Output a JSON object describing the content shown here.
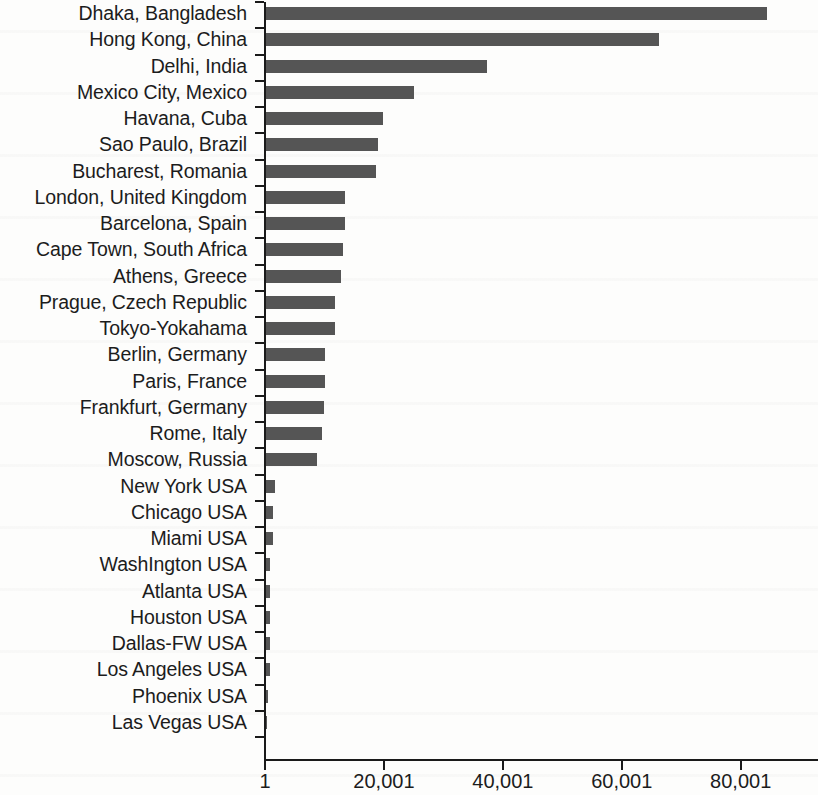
{
  "chart_data": {
    "type": "bar",
    "orientation": "horizontal",
    "title": "",
    "subtitle": "",
    "xlabel": "",
    "ylabel": "",
    "grid": false,
    "legend": null,
    "xlim": [
      1,
      93000
    ],
    "x_tick_labels": [
      "1",
      "20,001",
      "40,001",
      "60,001",
      "80,001"
    ],
    "x_tick_values": [
      1,
      20001,
      40001,
      60001,
      80001
    ],
    "bar_color": "#555555",
    "axis_color": "#1a1a1a",
    "categories": [
      "Dhaka, Bangladesh",
      "Hong Kong, China",
      "Delhi, India",
      "Mexico City, Mexico",
      "Havana, Cuba",
      "Sao Paulo, Brazil",
      "Bucharest, Romania",
      "London, United Kingdom",
      "Barcelona, Spain",
      "Cape Town, South Africa",
      "Athens, Greece",
      "Prague, Czech Republic",
      "Tokyo-Yokahama",
      "Berlin, Germany",
      "Paris, France",
      "Frankfurt, Germany",
      "Rome, Italy",
      "Moscow, Russia",
      "New York USA",
      "Chicago USA",
      "Miami USA",
      "WashIngton USA",
      "Atlanta USA",
      "Houston USA",
      "Dallas-FW USA",
      "Los Angeles USA",
      "Phoenix USA",
      "Las Vegas USA"
    ],
    "values": [
      84500,
      66300,
      37400,
      25100,
      19900,
      19000,
      18600,
      13500,
      13500,
      13200,
      12800,
      11700,
      11700,
      10100,
      10100,
      9900,
      9600,
      8800,
      1600,
      1300,
      1300,
      900,
      800,
      800,
      800,
      800,
      500,
      400
    ]
  }
}
